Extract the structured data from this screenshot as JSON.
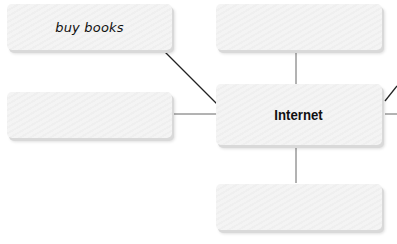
{
  "diagram": {
    "type": "mind-map",
    "center": {
      "id": "internet",
      "label": "Internet"
    },
    "nodes": [
      {
        "id": "buy-books",
        "label": "buy books",
        "position": "top-left"
      },
      {
        "id": "left-middle",
        "label": "",
        "position": "left"
      },
      {
        "id": "top-center",
        "label": "",
        "position": "top"
      },
      {
        "id": "bottom-center",
        "label": "",
        "position": "bottom"
      }
    ],
    "edges": [
      {
        "from": "internet",
        "to": "buy-books"
      },
      {
        "from": "internet",
        "to": "left-middle"
      },
      {
        "from": "internet",
        "to": "top-center"
      },
      {
        "from": "internet",
        "to": "bottom-center"
      },
      {
        "from": "internet",
        "to": "offscreen-upper-right"
      },
      {
        "from": "internet",
        "to": "offscreen-right"
      }
    ],
    "colors": {
      "node_fill": "#f4f4f4",
      "node_shadow": "#d9d9d9",
      "line": "#222222",
      "line_light": "#666666"
    }
  }
}
